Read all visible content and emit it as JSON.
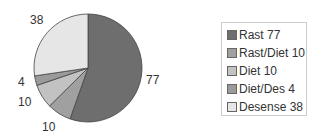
{
  "chart_data": {
    "type": "pie",
    "title": "",
    "categories": [
      "Rast",
      "Rast/Diet",
      "Diet",
      "Diet/Des",
      "Desense"
    ],
    "values": [
      77,
      10,
      10,
      4,
      38
    ],
    "colors": [
      "#6e6e6e",
      "#a0a0a0",
      "#c2c2c2",
      "#9a9a9a",
      "#e6e6e6"
    ],
    "data_labels": [
      "77",
      "10",
      "10",
      "4",
      "38"
    ],
    "legend": {
      "position": "right",
      "entries": [
        "Rast 77",
        "Rast/Diet 10",
        "Diet 10",
        "Diet/Des 4",
        "Desense 38"
      ]
    }
  }
}
